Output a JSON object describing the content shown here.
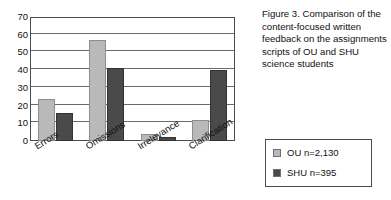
{
  "chart_data": {
    "type": "bar",
    "title": "",
    "xlabel": "",
    "ylabel": "",
    "ylim": [
      0,
      70
    ],
    "ytick_step": 10,
    "yticks": [
      "70",
      "60",
      "50",
      "40",
      "30",
      "20",
      "10",
      "0"
    ],
    "grid": true,
    "legend_position": "right-bottom-outside",
    "categories": [
      "Errors",
      "Omissions",
      "Irrelevance",
      "Clarification"
    ],
    "series": [
      {
        "name": "OU n=2,130",
        "color": "#b9b9b9",
        "values": [
          24,
          57,
          4,
          12
        ]
      },
      {
        "name": "SHU n=395",
        "color": "#4a4a4a",
        "values": [
          16,
          41,
          2,
          40
        ]
      }
    ]
  },
  "caption": {
    "text": "Figure 3. Comparison of the content-focused written feedback on the assignments scripts of OU and SHU science students"
  },
  "legend": {
    "items": [
      {
        "label": "OU n=2,130",
        "color": "#b9b9b9"
      },
      {
        "label": "SHU n=395",
        "color": "#4a4a4a"
      }
    ]
  }
}
